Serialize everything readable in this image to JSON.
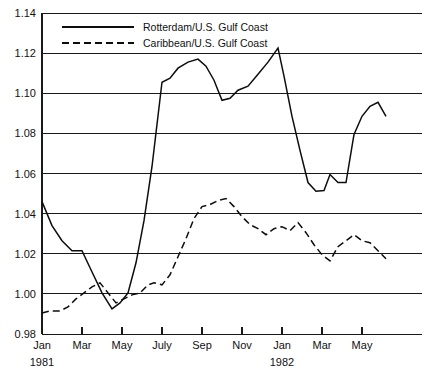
{
  "chart_data": {
    "type": "line",
    "title": "",
    "subtitle": "",
    "xlabel": "",
    "ylabel": "",
    "ylim": [
      0.98,
      1.14
    ],
    "ytick_labels": [
      "1.14",
      "1.12",
      "1.10",
      "1.08",
      "1.06",
      "1.04",
      "1.02",
      "1.00",
      "0.98"
    ],
    "ytick_values": [
      1.14,
      1.12,
      1.1,
      1.08,
      1.06,
      1.04,
      1.02,
      1.0,
      0.98
    ],
    "xtick_labels": [
      "Jan",
      "Mar",
      "May",
      "July",
      "Sep",
      "Nov",
      "Jan",
      "Mar",
      "May"
    ],
    "xtick_months": [
      0,
      2,
      4,
      6,
      8,
      10,
      12,
      14,
      16
    ],
    "year_labels": [
      {
        "text": "1981",
        "month_index": 0
      },
      {
        "text": "1982",
        "month_index": 12
      }
    ],
    "grid": "horizontal",
    "legend_position": "top-inside",
    "xlim_months": [
      0,
      19
    ],
    "series": [
      {
        "name": "Rotterdam/U.S. Gulf Coast",
        "style": "solid",
        "color": "#0d0d0d",
        "x": [
          0,
          0.5,
          1,
          1.5,
          2,
          2.4,
          3,
          3.5,
          3.9,
          4.3,
          4.7,
          5.1,
          5.5,
          6,
          6.4,
          6.8,
          7.3,
          7.8,
          8.2,
          8.6,
          9,
          9.4,
          9.8,
          10.3,
          10.8,
          11.3,
          11.8,
          12.1,
          12.5,
          12.9,
          13.3,
          13.7,
          14.1,
          14.4,
          14.8,
          15.2,
          15.6,
          16,
          16.4,
          16.8,
          17.2
        ],
        "y": [
          1.046,
          1.034,
          1.0265,
          1.0215,
          1.0215,
          1.013,
          1.0005,
          0.9925,
          0.9955,
          1.0005,
          1.0155,
          1.0365,
          1.0635,
          1.1055,
          1.1075,
          1.1125,
          1.1155,
          1.117,
          1.1135,
          1.1065,
          1.0965,
          1.0975,
          1.1015,
          1.1035,
          1.1095,
          1.1155,
          1.1225,
          1.1085,
          1.0885,
          1.0715,
          1.0555,
          1.0512,
          1.0515,
          1.0595,
          1.0555,
          1.0555,
          1.0795,
          1.0885,
          1.0935,
          1.0955,
          1.0885
        ]
      },
      {
        "name": "Caribbean/U.S. Gulf Coast",
        "style": "dashed",
        "color": "#0d0d0d",
        "x": [
          0,
          0.4,
          0.9,
          1.3,
          1.7,
          2.1,
          2.5,
          2.9,
          3.3,
          3.7,
          4.1,
          4.5,
          4.9,
          5.3,
          5.6,
          6,
          6.4,
          6.8,
          7.2,
          7.6,
          8,
          8.4,
          8.8,
          9.2,
          9.6,
          10,
          10.4,
          10.8,
          11.2,
          11.6,
          12,
          12.4,
          12.8,
          13.2,
          13.6,
          14,
          14.4,
          14.8,
          15.2,
          15.6,
          16,
          16.4,
          16.8,
          17.2
        ],
        "y": [
          0.9905,
          0.9915,
          0.9915,
          0.9935,
          0.9975,
          1.0005,
          1.0035,
          1.0055,
          1.0005,
          0.9955,
          0.9975,
          0.9995,
          1.0005,
          1.0045,
          1.0055,
          1.0045,
          1.0095,
          1.0185,
          1.0275,
          1.0375,
          1.0435,
          1.0445,
          1.0465,
          1.0475,
          1.0435,
          1.0385,
          1.0345,
          1.0325,
          1.0295,
          1.0325,
          1.0335,
          1.0315,
          1.0355,
          1.0305,
          1.0245,
          1.0195,
          1.0165,
          1.0235,
          1.0265,
          1.0295,
          1.0265,
          1.0255,
          1.0215,
          1.0175
        ]
      }
    ]
  },
  "legend": {
    "entries": [
      {
        "label": "Rotterdam/U.S. Gulf Coast",
        "style": "solid"
      },
      {
        "label": "Caribbean/U.S. Gulf Coast",
        "style": "dashed"
      }
    ]
  },
  "caption": {
    "fragment": ""
  }
}
